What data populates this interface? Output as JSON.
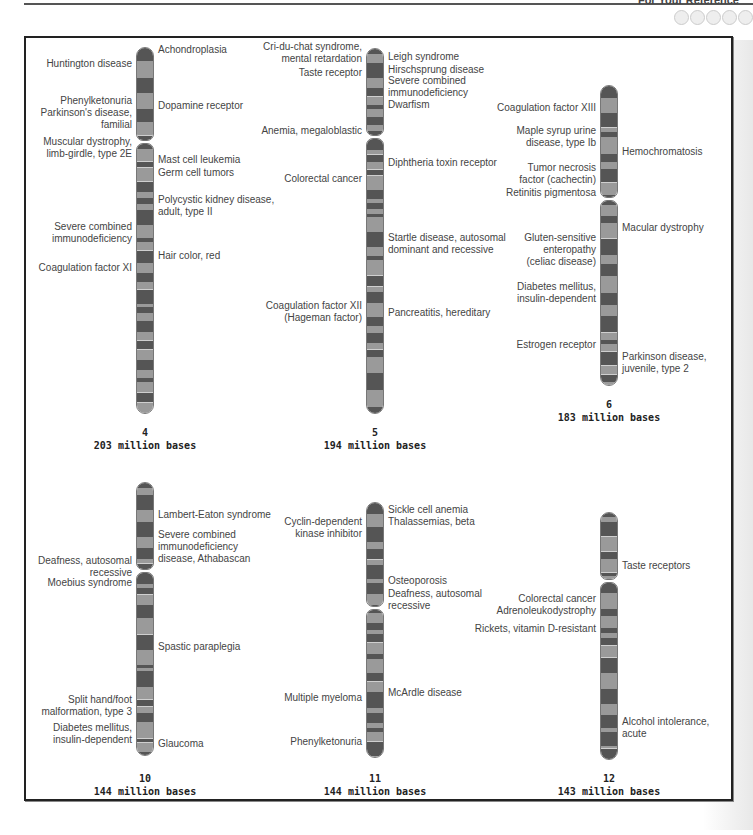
{
  "header": {
    "running_head": "For Your Reference"
  },
  "chromosomes": [
    {
      "number": "4",
      "size": "203 million bases",
      "left": [
        {
          "text": "Huntington disease",
          "y": 64
        },
        {
          "text": "Phenylketonuria\nParkinson's disease,\nfamilial",
          "y": 101
        },
        {
          "text": "Muscular dystrophy,\nlimb-girdle, type 2E",
          "y": 142
        },
        {
          "text": "Severe combined\nimmunodeficiency",
          "y": 227
        },
        {
          "text": "Coagulation factor XI",
          "y": 268
        }
      ],
      "right": [
        {
          "text": "Achondroplasia",
          "y": 50
        },
        {
          "text": "Dopamine receptor",
          "y": 106
        },
        {
          "text": "Mast cell leukemia",
          "y": 160
        },
        {
          "text": "Germ cell tumors",
          "y": 173
        },
        {
          "text": "Polycystic kidney disease,\nadult, type II",
          "y": 200
        },
        {
          "text": "Hair color, red",
          "y": 256
        }
      ]
    },
    {
      "number": "5",
      "size": "194 million bases",
      "left": [
        {
          "text": "Cri-du-chat syndrome,\nmental retardation",
          "y": 47
        },
        {
          "text": "Taste receptor",
          "y": 73
        },
        {
          "text": "Anemia, megaloblastic",
          "y": 131
        },
        {
          "text": "Colorectal cancer",
          "y": 179
        },
        {
          "text": "Coagulation factor XII\n(Hageman factor)",
          "y": 306
        }
      ],
      "right": [
        {
          "text": "Leigh syndrome",
          "y": 57
        },
        {
          "text": "Hirschsprung disease",
          "y": 70
        },
        {
          "text": "Severe combined\nimmunodeficiency",
          "y": 81
        },
        {
          "text": "Dwarfism",
          "y": 105
        },
        {
          "text": "Diphtheria toxin receptor",
          "y": 163
        },
        {
          "text": "Startle disease, autosomal\ndominant and recessive",
          "y": 238
        },
        {
          "text": "Pancreatitis, hereditary",
          "y": 313
        }
      ]
    },
    {
      "number": "6",
      "size": "183 million bases",
      "left": [
        {
          "text": "Coagulation factor XIII",
          "y": 108
        },
        {
          "text": "Maple syrup urine\ndisease, type Ib",
          "y": 131
        },
        {
          "text": "Tumor necrosis\nfactor (cachectin)",
          "y": 168
        },
        {
          "text": "Retinitis pigmentosa",
          "y": 193
        },
        {
          "text": "Gluten-sensitive\nenteropathy\n(celiac disease)",
          "y": 238
        },
        {
          "text": "Diabetes mellitus,\ninsulin-dependent",
          "y": 287
        },
        {
          "text": "Estrogen receptor",
          "y": 345
        }
      ],
      "right": [
        {
          "text": "Hemochromatosis",
          "y": 152
        },
        {
          "text": "Macular dystrophy",
          "y": 228
        },
        {
          "text": "Parkinson disease,\njuvenile, type 2",
          "y": 357
        }
      ]
    },
    {
      "number": "10",
      "size": "144 million bases",
      "left": [
        {
          "text": "Deafness, autosomal\nrecessive",
          "y": 561
        },
        {
          "text": "Moebius syndrome",
          "y": 583
        },
        {
          "text": "Split hand/foot\nmalformation, type 3",
          "y": 700
        },
        {
          "text": "Diabetes mellitus,\ninsulin-dependent",
          "y": 728
        }
      ],
      "right": [
        {
          "text": "Lambert-Eaton syndrome",
          "y": 515
        },
        {
          "text": "Severe combined\nimmunodeficiency\ndisease, Athabascan",
          "y": 535
        },
        {
          "text": "Spastic paraplegia",
          "y": 647
        },
        {
          "text": "Glaucoma",
          "y": 744
        }
      ]
    },
    {
      "number": "11",
      "size": "144 million bases",
      "left": [
        {
          "text": "Cyclin-dependent\nkinase inhibitor",
          "y": 522
        },
        {
          "text": "Multiple myeloma",
          "y": 698
        },
        {
          "text": "Phenylketonuria",
          "y": 742
        }
      ],
      "right": [
        {
          "text": "Sickle cell anemia",
          "y": 510
        },
        {
          "text": "Thalassemias, beta",
          "y": 522
        },
        {
          "text": "Osteoporosis",
          "y": 581
        },
        {
          "text": "Deafness, autosomal\nrecessive",
          "y": 594
        },
        {
          "text": "McArdle disease",
          "y": 693
        }
      ]
    },
    {
      "number": "12",
      "size": "143 million bases",
      "left": [
        {
          "text": "Colorectal cancer",
          "y": 599
        },
        {
          "text": "Adrenoleukodystrophy",
          "y": 611
        },
        {
          "text": "Rickets, vitamin D-resistant",
          "y": 629
        }
      ],
      "right": [
        {
          "text": "Taste receptors",
          "y": 566
        },
        {
          "text": "Alcohol intolerance,\nacute",
          "y": 722
        }
      ]
    }
  ],
  "colors": {
    "dark_band": "#555555",
    "light_band": "#9a9a9a",
    "centromere": "#5a5a5a",
    "outline": "#777777"
  }
}
